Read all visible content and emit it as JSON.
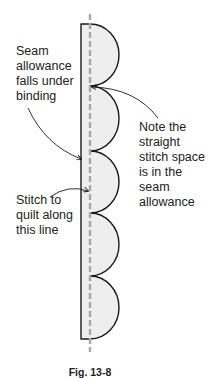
{
  "figure": {
    "caption": "Fig. 13-8",
    "colors": {
      "outline": "#1a1a1a",
      "fill": "#eeeeee",
      "dashed_line": "#a8a8a8",
      "text": "#222222"
    },
    "scallop_count": 5
  },
  "annotations": {
    "seam_allowance": "Seam\nallowance\nfalls under\nbinding",
    "note": "Note the\nstraight\nstitch space\nis in the\nseam\nallowance",
    "stitch_line": "Stitch to\nquilt along\nthis line"
  }
}
